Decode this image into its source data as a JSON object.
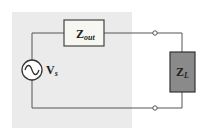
{
  "diagram": {
    "type": "circuit",
    "source_region": {
      "fill": "#ebebeb"
    },
    "wire_color": "#555555",
    "components": [
      {
        "id": "zout",
        "label_main": "Z",
        "label_sub": "out",
        "fill": "#f7f7f2"
      },
      {
        "id": "zl",
        "label_main": "Z",
        "label_sub": "L",
        "fill": "#8a8a8a"
      },
      {
        "id": "vs",
        "label_main": "V",
        "label_sub": "s",
        "symbol": "ac-source"
      }
    ],
    "terminals": [
      {
        "id": "top-terminal"
      },
      {
        "id": "bottom-terminal"
      }
    ]
  }
}
